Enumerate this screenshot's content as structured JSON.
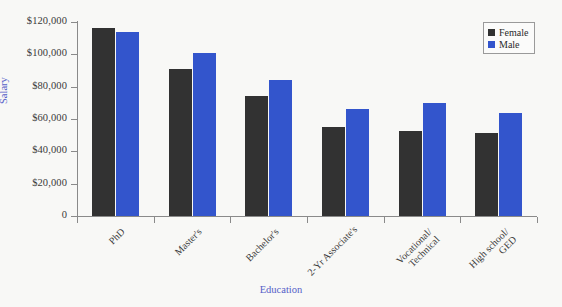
{
  "chart_data": {
    "type": "bar",
    "title": "",
    "xlabel": "Education",
    "ylabel": "Salary",
    "categories": [
      "PhD",
      "Master's",
      "Bachelor's",
      "2-Yr Associate's",
      "Vocational/\nTechnical",
      "High school/\nGED"
    ],
    "series": [
      {
        "name": "Female",
        "color": "#323232",
        "values": [
          116000,
          91000,
          74000,
          55000,
          52500,
          51500
        ]
      },
      {
        "name": "Male",
        "color": "#3355cc",
        "values": [
          114000,
          101000,
          84000,
          66000,
          70000,
          64000
        ]
      }
    ],
    "ylim": [
      0,
      120000
    ],
    "yticks": [
      0,
      20000,
      40000,
      60000,
      80000,
      100000,
      120000
    ],
    "ytick_labels": [
      "0",
      "$20,000",
      "$40,000",
      "$60,000",
      "$80,000",
      "$100,000",
      "$120,000"
    ],
    "grid": false,
    "legend_position": "top-right",
    "axis_label_color": "#5560c8",
    "background_color": "#f8f8f6"
  }
}
